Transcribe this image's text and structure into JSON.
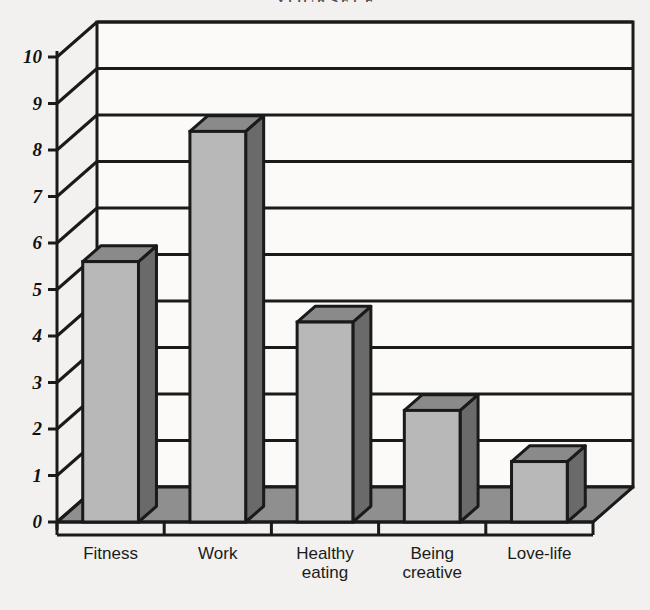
{
  "title_fragment": "YOURSELF",
  "chart_data": {
    "type": "bar",
    "title": "YOURSELF",
    "xlabel": "",
    "ylabel": "",
    "ylim": [
      0,
      10
    ],
    "yticks": [
      0,
      1,
      2,
      3,
      4,
      5,
      6,
      7,
      8,
      9,
      10
    ],
    "grid": true,
    "legend": false,
    "style": "3d-bar",
    "categories": [
      "Fitness",
      "Work",
      "Healthy eating",
      "Being creative",
      "Love-life"
    ],
    "values": [
      5.6,
      8.4,
      4.3,
      2.4,
      1.3
    ],
    "colors": {
      "bar_front": "#b8b8b8",
      "bar_side": "#6a6a6a",
      "bar_top": "#8a8a8a",
      "floor": "#8f8f8f",
      "wall": "#fbfaf8",
      "outline": "#1a1a1a",
      "background": "#f2f1ef"
    }
  },
  "axis": {
    "y_labels": [
      "10",
      "9",
      "8",
      "7",
      "6",
      "5",
      "4",
      "3",
      "2",
      "1",
      "0"
    ],
    "x_labels": [
      "Fitness",
      "Work",
      "Healthy\neating",
      "Being\ncreative",
      "Love-life"
    ]
  }
}
